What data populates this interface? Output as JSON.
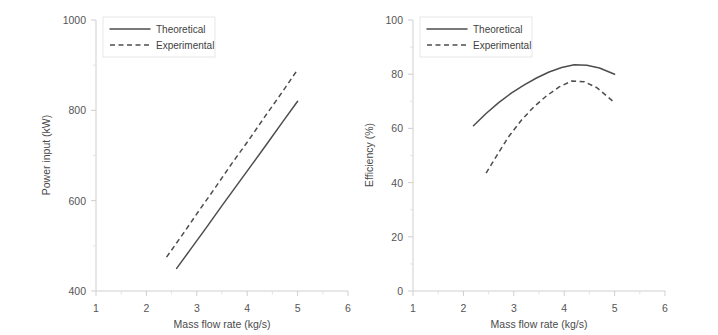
{
  "figure": {
    "background_color": "#ffffff",
    "line_color": "#4d4d4d",
    "axis_color": "#c9c9c9",
    "panel_count": 2
  },
  "chart_data": [
    {
      "type": "line",
      "panel": "left",
      "title": "",
      "xlabel": "Mass flow rate (kg/s)",
      "ylabel": "Power input (kW)",
      "xlim": [
        1,
        6
      ],
      "ylim": [
        400,
        1000
      ],
      "xticks": [
        1,
        2,
        3,
        4,
        5,
        6
      ],
      "xtick_labels": [
        "1",
        "2",
        "3",
        "4",
        "5",
        "6"
      ],
      "yticks": [
        400,
        600,
        800,
        1000
      ],
      "ytick_labels": [
        "400",
        "600",
        "800",
        "1000"
      ],
      "grid": false,
      "legend_position": "top-left",
      "series": [
        {
          "name": "Theoretical",
          "style": "solid",
          "x": [
            2.6,
            2.9,
            3.2,
            3.5,
            3.8,
            4.1,
            4.4,
            4.7,
            5.0
          ],
          "values": [
            450,
            496,
            542,
            589,
            635,
            681,
            727,
            774,
            820
          ]
        },
        {
          "name": "Experimental",
          "style": "dashed",
          "x": [
            2.4,
            2.73,
            3.05,
            3.38,
            3.7,
            4.03,
            4.35,
            4.68,
            5.0
          ],
          "values": [
            475,
            527,
            579,
            631,
            683,
            734,
            786,
            838,
            890
          ]
        }
      ]
    },
    {
      "type": "line",
      "panel": "right",
      "title": "",
      "xlabel": "Mass flow rate (kg/s)",
      "ylabel": "Efficiency (%)",
      "xlim": [
        1,
        6
      ],
      "ylim": [
        0,
        100
      ],
      "xticks": [
        1,
        2,
        3,
        4,
        5,
        6
      ],
      "xtick_labels": [
        "1",
        "2",
        "3",
        "4",
        "5",
        "6"
      ],
      "yticks": [
        0,
        20,
        40,
        60,
        80,
        100
      ],
      "ytick_labels": [
        "0",
        "20",
        "40",
        "60",
        "80",
        "100"
      ],
      "grid": false,
      "legend_position": "top-left",
      "series": [
        {
          "name": "Theoretical",
          "style": "solid",
          "x": [
            2.2,
            2.45,
            2.7,
            2.95,
            3.2,
            3.45,
            3.7,
            3.95,
            4.2,
            4.45,
            4.7,
            5.0
          ],
          "values": [
            61.0,
            65.5,
            69.5,
            73.0,
            76.0,
            78.6,
            80.8,
            82.5,
            83.5,
            83.3,
            82.3,
            80.0
          ]
        },
        {
          "name": "Experimental",
          "style": "dashed",
          "x": [
            2.45,
            2.68,
            2.9,
            3.15,
            3.4,
            3.65,
            3.9,
            4.15,
            4.4,
            4.65,
            5.0
          ],
          "values": [
            43.5,
            50.5,
            57.0,
            63.0,
            68.0,
            72.0,
            75.3,
            77.5,
            77.2,
            75.0,
            69.5
          ]
        }
      ]
    }
  ]
}
